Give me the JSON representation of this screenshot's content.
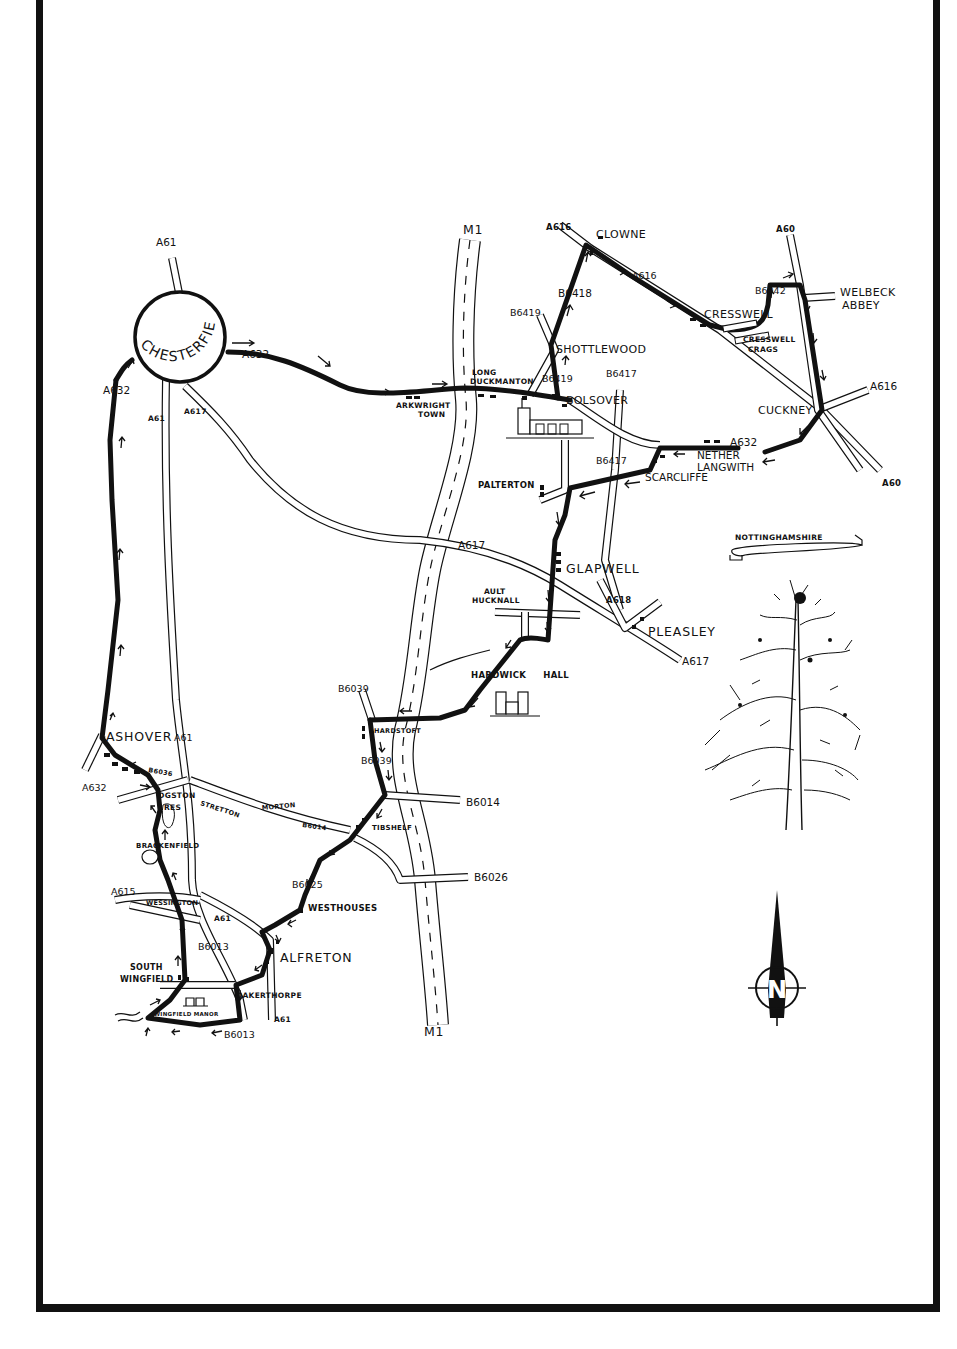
{
  "map": {
    "title_banner": "NOTTINGHAMSHIRE",
    "compass_letter": "N",
    "colors": {
      "ink": "#111111",
      "paper": "#ffffff"
    },
    "towns": {
      "chesterfield": "CHESTERFIELD",
      "clowne": "CLOWNE",
      "cresswell": "CRESSWELL",
      "cresswell_crags_1": "CRESSWELL",
      "cresswell_crags_2": "CRAGS",
      "welbeck_1": "WELBECK",
      "welbeck_2": "ABBEY",
      "shottlewood": "SHOTTLEWOOD",
      "long_duckmanton_1": "LONG",
      "long_duckmanton_2": "DUCKMANTON",
      "arkwright_1": "ARKWRIGHT",
      "arkwright_2": "TOWN",
      "bolsover": "BOLSOVER",
      "cuckney": "CUCKNEY",
      "nether_langwith_1": "NETHER",
      "nether_langwith_2": "LANGWITH",
      "scarcliffe": "SCARCLIFFE",
      "palterton": "PALTERTON",
      "clapwell": "GLAPWELL",
      "ault_hucknall_1": "AULT",
      "ault_hucknall_2": "HUCKNALL",
      "pleasley": "PLEASLEY",
      "hardwick_hall": "HARDWICK HALL",
      "hardstoft": "HARDSTOFT",
      "ashover": "ASHOVER",
      "ogston_1": "OGSTON",
      "ogston_2": "RES",
      "stretton": "STRETTON",
      "morton": "MORTON",
      "tibshelf": "TIBSHELF",
      "brackenfield": "BRACKENFIELD",
      "wessington": "WESSINGTON",
      "westhouses": "WESTHOUSES",
      "alfreton": "ALFRETON",
      "south_wingfield_1": "SOUTH",
      "south_wingfield_2": "WINGFIELD",
      "oakerthorpe": "OAKERTHORPE",
      "wingfield_manor": "WINGFIELD MANOR"
    },
    "roads": {
      "a61_top": "A61",
      "a61_chest": "A61",
      "a61_ashover": "A61",
      "a61_alfreton": "A61",
      "a61_south": "A61",
      "a617_chest": "A617",
      "a617_mid": "A617",
      "a617_pleasley": "A617",
      "a632_east": "A632",
      "a632_west": "A632",
      "a632_ashover": "A632",
      "a632_langwith": "A632",
      "m1_top": "M1",
      "m1_bottom": "M1",
      "a616_clowne": "A616",
      "a616_mid": "A616",
      "a616_cuckney": "A616",
      "a60_top": "A60",
      "a60_bottom": "A60",
      "b6042": "B6042",
      "b6418": "B6418",
      "b6419_a": "B6419",
      "b6419_b": "B6419",
      "b6417_a": "B6417",
      "b6417_b": "B6417",
      "a618": "A618",
      "b6039_a": "B6039",
      "b6039_b": "B6039",
      "b6014_a": "B6014",
      "b6014_b": "B6014",
      "b6026": "B6026",
      "b6036": "B6036",
      "b6025": "B6025",
      "b6013_a": "B6013",
      "b6013_b": "B6013",
      "a615": "A615"
    }
  }
}
